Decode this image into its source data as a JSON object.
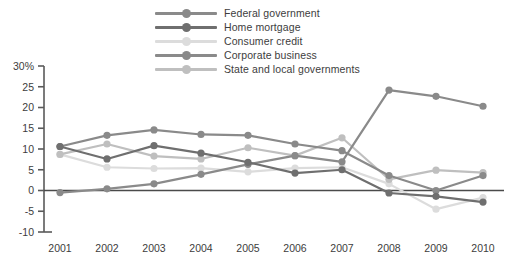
{
  "chart_data": {
    "type": "line",
    "title": "",
    "subtitle": "",
    "xlabel": "",
    "ylabel": "",
    "categories": [
      "2001",
      "2002",
      "2003",
      "2004",
      "2005",
      "2006",
      "2007",
      "2008",
      "2009",
      "2010"
    ],
    "x": [
      2001,
      2002,
      2003,
      2004,
      2005,
      2006,
      2007,
      2008,
      2009,
      2010
    ],
    "ylim": [
      -10,
      30
    ],
    "yticks": [
      -10,
      -5,
      0,
      5,
      10,
      15,
      20,
      25,
      30
    ],
    "ytick_labels": [
      "-10",
      "-5",
      "0",
      "5",
      "10",
      "15",
      "20",
      "25",
      "30%"
    ],
    "grid": false,
    "legend_position": "top-center",
    "zero_line": true,
    "series": [
      {
        "name": "Federal government",
        "color": "#8a8a8a",
        "values": [
          -0.5,
          0.4,
          1.6,
          3.9,
          6.3,
          8.4,
          6.9,
          24.2,
          22.7,
          20.3
        ]
      },
      {
        "name": "Home mortgage",
        "color": "#6f6f6f",
        "values": [
          10.6,
          7.6,
          10.8,
          9.0,
          6.8,
          4.2,
          5.0,
          -0.6,
          -1.4,
          -2.8
        ]
      },
      {
        "name": "Consumer credit",
        "color": "#dcdcdc",
        "values": [
          8.7,
          5.6,
          5.3,
          5.4,
          4.5,
          5.4,
          5.6,
          1.6,
          -4.5,
          -1.7
        ]
      },
      {
        "name": "Corporate business",
        "color": "#8a8a8a",
        "values": [
          10.6,
          13.3,
          14.6,
          13.5,
          13.3,
          11.2,
          9.6,
          3.6,
          0.0,
          3.6
        ]
      },
      {
        "name": "State and local governments",
        "color": "#bfbfbf",
        "values": [
          8.7,
          11.2,
          8.3,
          7.6,
          10.3,
          8.4,
          12.7,
          2.7,
          4.9,
          4.3
        ]
      }
    ]
  },
  "legend": {
    "items": [
      {
        "label": "Federal government",
        "icon": "line-marker-icon"
      },
      {
        "label": "Home mortgage",
        "icon": "line-marker-icon"
      },
      {
        "label": "Consumer credit",
        "icon": "line-marker-icon"
      },
      {
        "label": "Corporate business",
        "icon": "line-marker-icon"
      },
      {
        "label": "State and local governments",
        "icon": "line-marker-icon"
      }
    ]
  }
}
